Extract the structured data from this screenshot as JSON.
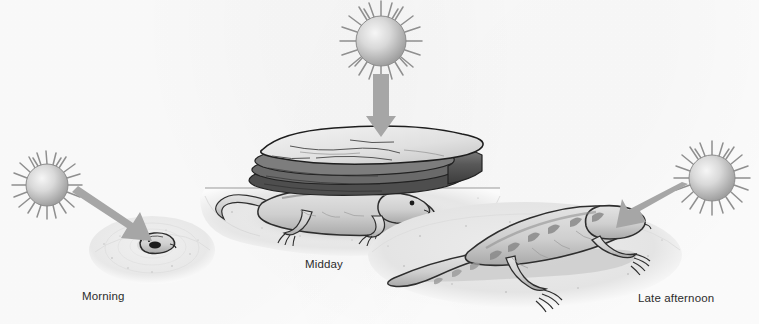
{
  "figure": {
    "background_color": "#fdfdfd",
    "width": 759,
    "height": 324
  },
  "palette": {
    "sun_fill_center": "#f2f2f2",
    "sun_fill_edge": "#9a9a9a",
    "sun_ray": "#8f8f8f",
    "arrow": "#a6a6a6",
    "ground": "#e8e8e8",
    "ground_edge": "#d2d2d2",
    "shadow": "#c4c4c4",
    "rock_top": "#e9e9e9",
    "rock_side": "#5a5a5a",
    "lizard_body": "#d8d8d8",
    "lizard_outline": "#2e2e2e",
    "label_text": "#2c2c2c"
  },
  "panels": [
    {
      "id": "morning",
      "label": "Morning",
      "label_x": 82,
      "label_y": 290,
      "sun": {
        "name": "sun-morning",
        "cx": 47,
        "cy": 185,
        "radius": 21,
        "ray_count": 22,
        "position": "low-left"
      },
      "arrow": {
        "name": "sunlight-arrow-morning",
        "direction": "down-right",
        "angle_deg": 38,
        "x1": 78,
        "y1": 192,
        "x2": 148,
        "y2": 240
      },
      "ground": {
        "name": "ground-mound-morning",
        "cx": 152,
        "cy": 248,
        "rx": 62,
        "ry": 33,
        "description": "low sandy mound"
      },
      "animal": {
        "name": "lizard-morning",
        "posture": "small, curled, head-on, warming up",
        "facing": "viewer",
        "scale": "small",
        "cx": 152,
        "cy": 241
      }
    },
    {
      "id": "midday",
      "label": "Midday",
      "label_x": 305,
      "label_y": 258,
      "sun": {
        "name": "sun-midday",
        "cx": 381,
        "cy": 41,
        "radius": 25,
        "ray_count": 24,
        "position": "overhead"
      },
      "arrow": {
        "name": "sunlight-arrow-midday",
        "direction": "down",
        "angle_deg": 90,
        "x1": 381,
        "y1": 74,
        "x2": 381,
        "y2": 126
      },
      "ground": {
        "name": "ground-patch-midday",
        "cx": 350,
        "cy": 200,
        "rx": 150,
        "ry": 45,
        "description": "flat ground with horizon line"
      },
      "rock": {
        "name": "shelter-rock-midday",
        "description": "layered flat rock slab providing shade",
        "x": 250,
        "y": 128,
        "width": 210,
        "height": 62
      },
      "animal": {
        "name": "lizard-midday",
        "posture": "sheltering in shade beneath rock",
        "facing": "right",
        "scale": "large",
        "cx": 355,
        "cy": 212
      }
    },
    {
      "id": "late-afternoon",
      "label": "Late afternoon",
      "label_x": 638,
      "label_y": 292,
      "sun": {
        "name": "sun-late-afternoon",
        "cx": 712,
        "cy": 178,
        "radius": 23,
        "ray_count": 22,
        "position": "low-right"
      },
      "arrow": {
        "name": "sunlight-arrow-late-afternoon",
        "direction": "down-left",
        "angle_deg": 218,
        "x1": 686,
        "y1": 192,
        "x2": 628,
        "y2": 226
      },
      "ground": {
        "name": "ground-patch-late-afternoon",
        "cx": 525,
        "cy": 255,
        "rx": 155,
        "ry": 52,
        "description": "open sunlit sand"
      },
      "animal": {
        "name": "lizard-late-afternoon",
        "posture": "basking in the open, fully extended",
        "facing": "right",
        "scale": "large",
        "cx": 525,
        "cy": 250
      }
    }
  ]
}
